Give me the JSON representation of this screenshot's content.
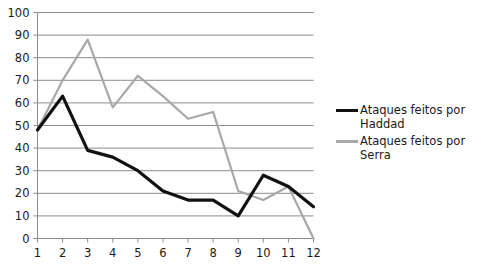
{
  "chart_data": {
    "type": "line",
    "title": "",
    "xlabel": "",
    "ylabel": "",
    "x": [
      1,
      2,
      3,
      4,
      5,
      6,
      7,
      8,
      9,
      10,
      11,
      12
    ],
    "categories": [
      "1",
      "2",
      "3",
      "4",
      "5",
      "6",
      "7",
      "8",
      "9",
      "10",
      "11",
      "12"
    ],
    "xlim": [
      1,
      12
    ],
    "ylim": [
      0,
      100
    ],
    "yticks": [
      0,
      10,
      20,
      30,
      40,
      50,
      60,
      70,
      80,
      90,
      100
    ],
    "ytick_labels": [
      "0",
      "10",
      "20",
      "30",
      "40",
      "50",
      "60",
      "70",
      "80",
      "90",
      "100"
    ],
    "xtick_labels": [
      "1",
      "2",
      "3",
      "4",
      "5",
      "6",
      "7",
      "8",
      "9",
      "10",
      "11",
      "12"
    ],
    "grid": "horizontal",
    "legend_position": "right",
    "series": [
      {
        "name": "Ataques feitos por Haddad",
        "color": "#111111",
        "line_width": 3.2,
        "values": [
          48,
          63,
          39,
          36,
          30,
          21,
          17,
          17,
          10,
          28,
          23,
          14
        ]
      },
      {
        "name": "Ataques feitos por Serra",
        "color": "#a8a8a8",
        "line_width": 2.2,
        "values": [
          48,
          70,
          88,
          58,
          72,
          63,
          53,
          56,
          21,
          17,
          23,
          0
        ]
      }
    ]
  },
  "axes": {
    "grid_color": "#8c8c8c",
    "axis_color": "#8c8c8c",
    "background": "#ffffff"
  },
  "legend": {
    "entries": [
      {
        "label": "Ataques feitos por\nHaddad",
        "icon": "line-swatch-black"
      },
      {
        "label": "Ataques feitos por\nSerra",
        "icon": "line-swatch-gray"
      }
    ]
  }
}
